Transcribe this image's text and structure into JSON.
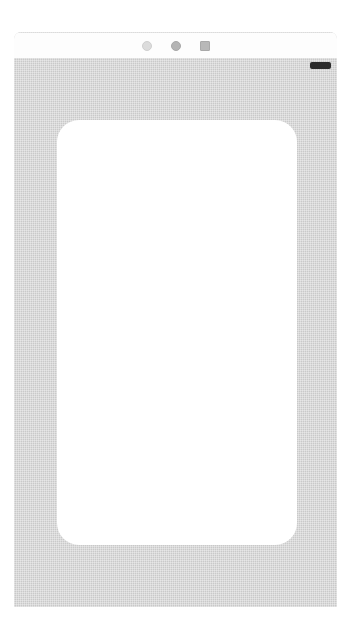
{
  "canvas": {
    "width": 351,
    "height": 641,
    "background_color": "#ffffff"
  },
  "device": {
    "name": "tablet-device-mockup",
    "frame_color": "#c9c9c9",
    "frame_texture": "dithered-halftone",
    "screen_color": "#ffffff",
    "orientation": "portrait"
  },
  "top_strip": {
    "name": "status-strip",
    "background_color": "#fdfdfd",
    "icons": [
      {
        "name": "circle-outline-icon",
        "shape": "circle-outline",
        "color": "#dcdcdc"
      },
      {
        "name": "circle-filled-icon",
        "shape": "circle-filled",
        "color": "#b4b4b4"
      },
      {
        "name": "square-icon",
        "shape": "square",
        "color": "#b8b8b8"
      }
    ]
  },
  "indicator": {
    "name": "battery-indicator",
    "shape": "rounded-pill",
    "color": "#2b2b2b"
  },
  "screen": {
    "name": "device-screen",
    "content": "",
    "background_color": "#ffffff"
  }
}
